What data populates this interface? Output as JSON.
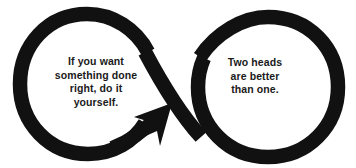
{
  "graphic": {
    "type": "infinity-loop-arrow-diagram",
    "background_color": "#ffffff",
    "stroke_color": "#111111",
    "text_color": "#1a1a1a",
    "stroke_width_px": 14,
    "left_loop": {
      "center_x": 88,
      "center_y": 83,
      "radius": 67,
      "direction": "counterclockwise",
      "terminates_in": "arrowhead"
    },
    "right_loop": {
      "center_x": 266,
      "center_y": 86,
      "radius": 70,
      "direction": "clockwise",
      "terminates_in": "blunt-cut"
    },
    "arrowhead": {
      "tip_x": 170,
      "tip_y": 106,
      "points": "up-right"
    }
  },
  "quotes": {
    "left": {
      "name": "self-reliance-quote",
      "lines": [
        "If you want",
        "something done",
        "right, do it",
        "yourself."
      ]
    },
    "right": {
      "name": "collaboration-quote",
      "lines": [
        "Two heads",
        "are better",
        "than one."
      ]
    }
  }
}
